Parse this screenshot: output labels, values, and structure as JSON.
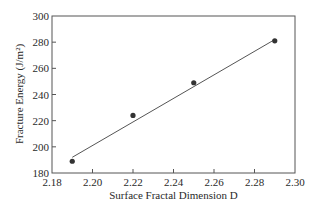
{
  "chart_data": {
    "type": "scatter",
    "title": "",
    "xlabel": "Surface Fractal Dimension D",
    "ylabel": "Fracture Energy (J/m²)",
    "xlim": [
      2.18,
      2.3
    ],
    "ylim": [
      180,
      300
    ],
    "x_ticks": [
      "2.18",
      "2.20",
      "2.22",
      "2.24",
      "2.26",
      "2.28",
      "2.30"
    ],
    "y_ticks": [
      "180",
      "200",
      "220",
      "240",
      "260",
      "280",
      "300"
    ],
    "grid": false,
    "legend": null,
    "series": [
      {
        "name": "Measured",
        "type": "scatter",
        "x": [
          2.19,
          2.22,
          2.25,
          2.29
        ],
        "y": [
          189,
          224,
          249,
          281
        ]
      },
      {
        "name": "Linear fit",
        "type": "line",
        "x": [
          2.19,
          2.29
        ],
        "y": [
          192,
          282
        ]
      }
    ],
    "colors": {
      "marker": "#333333",
      "line": "#555555",
      "axis": "#444444"
    }
  }
}
